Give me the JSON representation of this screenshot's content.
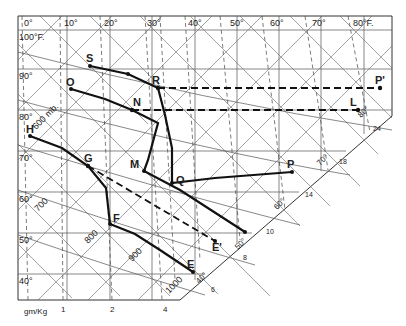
{
  "diagram": {
    "type": "thermodynamic-chart",
    "top_axis_labels": [
      "0°",
      "10°",
      "20°",
      "30°",
      "40°",
      "50°",
      "60°",
      "70°",
      "80°F."
    ],
    "left_axis_labels": [
      "100°F.",
      "90°",
      "80°",
      "70°",
      "60°",
      "50°",
      "40°"
    ],
    "bottom_axis_unit": "gm/Kg",
    "bottom_axis_labels": [
      "1",
      "2",
      "4"
    ],
    "pressure_labels": [
      "600 mb.",
      "700",
      "800",
      "900",
      "1000"
    ],
    "diagonal_edge_labels": [
      "6",
      "8",
      "10",
      "14",
      "18",
      "24"
    ],
    "edge_temp_labels": [
      "40°",
      "50°",
      "60°",
      "70°",
      "80°"
    ],
    "points": [
      "S",
      "R",
      "P'",
      "O",
      "N",
      "L",
      "H",
      "G",
      "M",
      "Q",
      "P",
      "F",
      "E'",
      "E"
    ]
  }
}
